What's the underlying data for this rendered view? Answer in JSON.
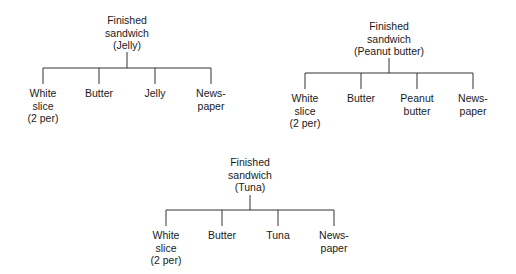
{
  "trees": [
    {
      "root": "Finished\nsandwich\n(Jelly)",
      "children": [
        "White\nslice\n(2 per)",
        "Butter",
        "Jelly",
        "News-\npaper"
      ]
    },
    {
      "root": "Finished\nsandwich\n(Peanut butter)",
      "children": [
        "White\nslice\n(2 per)",
        "Butter",
        "Peanut\nbutter",
        "News-\npaper"
      ]
    },
    {
      "root": "Finished\nsandwich\n(Tuna)",
      "children": [
        "White\nslice\n(2 per)",
        "Butter",
        "Tuna",
        "News-\npaper"
      ]
    }
  ]
}
